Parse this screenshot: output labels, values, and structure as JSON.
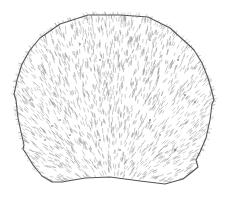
{
  "figure": {
    "width": 225,
    "height": 202,
    "background": "#ffffff",
    "outline_color": "#555555",
    "hair_color": "#8a8a8a",
    "fringe_color": "#9a9a9a",
    "pit_color": "#444444",
    "outline_points": [
      [
        40,
        38
      ],
      [
        60,
        24
      ],
      [
        88,
        15
      ],
      [
        120,
        15
      ],
      [
        148,
        17
      ],
      [
        170,
        28
      ],
      [
        190,
        46
      ],
      [
        194,
        50
      ],
      [
        202,
        63
      ],
      [
        208,
        78
      ],
      [
        212,
        92
      ],
      [
        214,
        100
      ],
      [
        212,
        104
      ],
      [
        210,
        120
      ],
      [
        206,
        138
      ],
      [
        200,
        152
      ],
      [
        196,
        160
      ],
      [
        198,
        167
      ],
      [
        192,
        172
      ],
      [
        183,
        179
      ],
      [
        165,
        184
      ],
      [
        140,
        181
      ],
      [
        110,
        177
      ],
      [
        85,
        178
      ],
      [
        62,
        182
      ],
      [
        52,
        182
      ],
      [
        42,
        176
      ],
      [
        33,
        165
      ],
      [
        27,
        155
      ],
      [
        23,
        149
      ],
      [
        24,
        145
      ],
      [
        21,
        132
      ],
      [
        18,
        118
      ],
      [
        16,
        100
      ],
      [
        14,
        94
      ],
      [
        15,
        90
      ],
      [
        17,
        80
      ],
      [
        22,
        64
      ],
      [
        30,
        50
      ]
    ],
    "pits": [
      [
        80,
        44
      ],
      [
        150,
        40
      ],
      [
        178,
        60
      ],
      [
        60,
        120
      ],
      [
        52,
        126
      ],
      [
        70,
        135
      ],
      [
        150,
        120
      ],
      [
        160,
        135
      ],
      [
        175,
        150
      ],
      [
        45,
        140
      ],
      [
        100,
        140
      ],
      [
        120,
        150
      ],
      [
        185,
        95
      ],
      [
        30,
        100
      ],
      [
        100,
        60
      ],
      [
        195,
        102
      ]
    ],
    "hair_count": 2600,
    "fringe_count": 220
  }
}
